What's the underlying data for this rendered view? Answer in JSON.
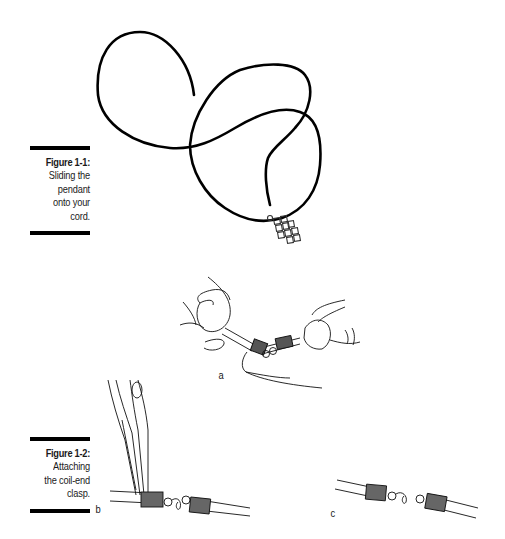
{
  "figures": [
    {
      "id": "figure-1-1",
      "label": "Figure 1-1:",
      "caption_lines": [
        "Sliding the",
        "pendant",
        "onto your",
        "cord."
      ]
    },
    {
      "id": "figure-1-2",
      "label": "Figure 1-2:",
      "caption_lines": [
        "Attaching",
        "the coil-end",
        "clasp."
      ],
      "panels": [
        {
          "label": "a"
        },
        {
          "label": "b"
        },
        {
          "label": "c"
        }
      ]
    }
  ],
  "colors": {
    "ink": "#000000",
    "text": "#1a1a1a",
    "background": "#ffffff"
  }
}
